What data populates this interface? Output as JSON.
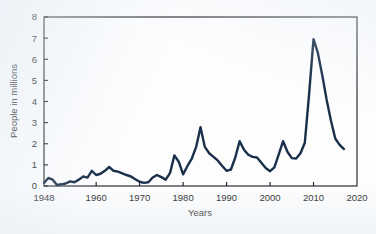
{
  "chart_data": {
    "type": "line",
    "title": "",
    "subtitle": "",
    "xlabel": "Years",
    "ylabel": "People in millions",
    "xlim": [
      1948,
      2020
    ],
    "ylim": [
      0,
      8
    ],
    "grid": false,
    "legend": null,
    "x_ticks": [
      1948,
      1960,
      1970,
      1980,
      1990,
      2000,
      2010,
      2020
    ],
    "x_tick_labels": [
      "1948",
      "1960",
      "1970",
      "1980",
      "1990",
      "2000",
      "2010",
      "2020"
    ],
    "y_ticks": [
      0,
      1,
      2,
      3,
      4,
      5,
      6,
      7,
      8
    ],
    "y_tick_labels": [
      "0",
      "1",
      "2",
      "3",
      "4",
      "5",
      "6",
      "7",
      "8"
    ],
    "series": [
      {
        "name": "People in millions",
        "color": "#1a2f4a",
        "x": [
          1948,
          1949,
          1950,
          1951,
          1952,
          1953,
          1954,
          1955,
          1956,
          1957,
          1958,
          1959,
          1960,
          1961,
          1962,
          1963,
          1964,
          1965,
          1966,
          1967,
          1968,
          1969,
          1970,
          1971,
          1972,
          1973,
          1974,
          1975,
          1976,
          1977,
          1978,
          1979,
          1980,
          1981,
          1982,
          1983,
          1984,
          1985,
          1986,
          1987,
          1988,
          1989,
          1990,
          1991,
          1992,
          1993,
          1994,
          1995,
          1996,
          1997,
          1998,
          1999,
          2000,
          2001,
          2002,
          2003,
          2004,
          2005,
          2006,
          2007,
          2008,
          2009,
          2010,
          2011,
          2012,
          2013,
          2014,
          2015,
          2016,
          2017
        ],
        "values": [
          0.15,
          0.38,
          0.3,
          0.05,
          0.08,
          0.12,
          0.22,
          0.18,
          0.3,
          0.45,
          0.4,
          0.72,
          0.52,
          0.58,
          0.72,
          0.9,
          0.72,
          0.68,
          0.6,
          0.52,
          0.45,
          0.32,
          0.2,
          0.15,
          0.18,
          0.4,
          0.52,
          0.42,
          0.3,
          0.62,
          1.45,
          1.15,
          0.55,
          0.95,
          1.3,
          1.85,
          2.78,
          1.85,
          1.55,
          1.38,
          1.2,
          0.95,
          0.72,
          0.78,
          1.35,
          2.12,
          1.72,
          1.48,
          1.38,
          1.35,
          1.1,
          0.85,
          0.7,
          0.88,
          1.5,
          2.12,
          1.62,
          1.32,
          1.3,
          1.55,
          2.05,
          4.4,
          6.95,
          6.3,
          5.25,
          4.1,
          3.1,
          2.25,
          1.95,
          1.75
        ]
      }
    ],
    "annotations": []
  }
}
